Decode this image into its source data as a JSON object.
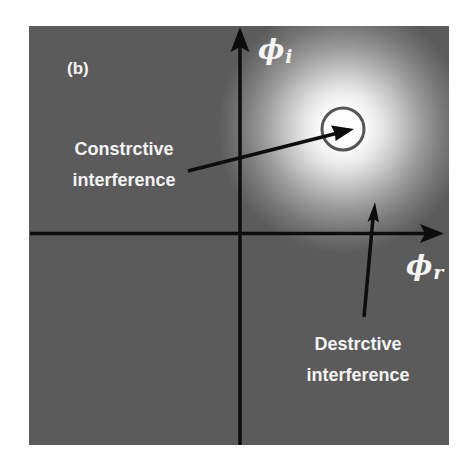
{
  "figure": {
    "panel_label": "(b)",
    "background_color": "#5b5b5b",
    "glow_color": "#ffffff",
    "axis_color": "#0d0d0d",
    "axes": {
      "vertical": {
        "symbol": "ϕ",
        "subscript": "i"
      },
      "horizontal": {
        "symbol": "ϕ",
        "subscript": "r"
      }
    },
    "annotations": {
      "constructive": {
        "line1": "Constrctive",
        "line2": "interference"
      },
      "destructive": {
        "line1": "Destrctive",
        "line2": "interference"
      }
    },
    "marker": {
      "shape": "circle",
      "description": "constructive-interference point"
    }
  }
}
